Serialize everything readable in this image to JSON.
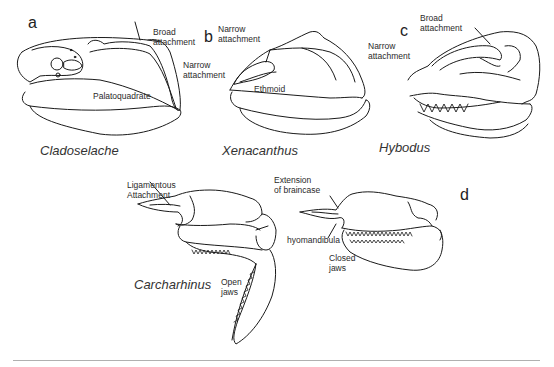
{
  "figure": {
    "panels": [
      {
        "id": "a",
        "letter": "a",
        "species": "Cladoselache",
        "labels": {
          "broad": "Broad\nattachment",
          "palatoquadrate": "Palatoquadrate"
        }
      },
      {
        "id": "b",
        "letter": "b",
        "species": "Xenacanthus",
        "labels": {
          "narrow_top": "Narrow\nattachment",
          "narrow_side": "Narrow\nattachment",
          "ethmoid": "Ethmoid"
        }
      },
      {
        "id": "c",
        "letter": "c",
        "species": "Hybodus",
        "labels": {
          "broad": "Broad\nattachment",
          "narrow": "Narrow\nattachment"
        }
      },
      {
        "id": "d",
        "letter": "d",
        "species": "Carcharhinus",
        "labels": {
          "ligamentous": "Ligamentous\nAttachment",
          "extension": "Extension\nof braincase",
          "hyomandibula": "hyomandibula",
          "open_jaws": "Open\njaws",
          "closed_jaws": "Closed\njaws"
        }
      }
    ],
    "colors": {
      "line": "#1a1a1a",
      "rule": "#b0b0b0",
      "background": "#ffffff"
    }
  }
}
